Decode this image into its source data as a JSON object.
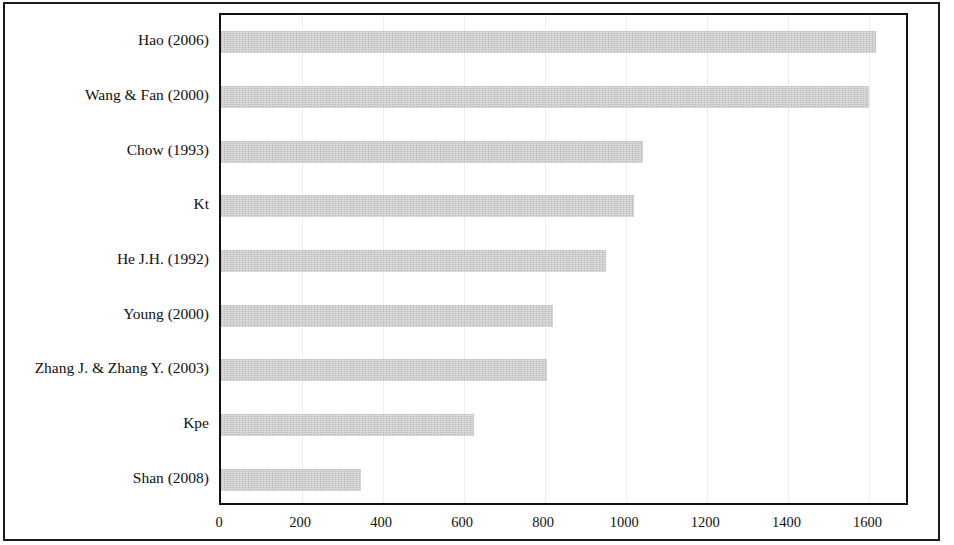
{
  "chart_data": {
    "type": "bar",
    "orientation": "horizontal",
    "title": "",
    "subtitle": "",
    "xlabel": "",
    "ylabel": "",
    "xlim": [
      0,
      1700
    ],
    "xticks": [
      0,
      200,
      400,
      600,
      800,
      1000,
      1200,
      1400,
      1600
    ],
    "xtick_labels": [
      "0",
      "200",
      "400",
      "600",
      "800",
      "1000",
      "1200",
      "1400",
      "1600"
    ],
    "grid": "vertical-faint",
    "legend": "none",
    "bar_color": "#c8c8c8",
    "axis_color": "#111111",
    "categories": [
      "Hao (2006)",
      "Wang & Fan (2000)",
      "Chow (1993)",
      "Kt",
      "He J.H. (1992)",
      "Young (2000)",
      "Zhang J. & Zhang Y. (2003)",
      "Kpe",
      "Shan (2008)"
    ],
    "values": [
      1615,
      1600,
      1040,
      1020,
      950,
      820,
      805,
      625,
      345
    ]
  }
}
